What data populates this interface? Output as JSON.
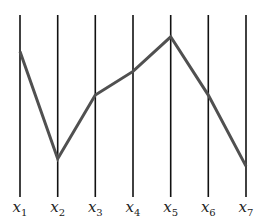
{
  "chart_data": {
    "type": "parallel-coordinates",
    "title": "",
    "axes": [
      "x1",
      "x2",
      "x3",
      "x4",
      "x5",
      "x6",
      "x7"
    ],
    "axis_labels": [
      {
        "base": "x",
        "sub": "1"
      },
      {
        "base": "x",
        "sub": "2"
      },
      {
        "base": "x",
        "sub": "3"
      },
      {
        "base": "x",
        "sub": "4"
      },
      {
        "base": "x",
        "sub": "5"
      },
      {
        "base": "x",
        "sub": "6"
      },
      {
        "base": "x",
        "sub": "7"
      }
    ],
    "series": [
      {
        "name": "polyline",
        "values": [
          0.8,
          0.21,
          0.56,
          0.69,
          0.88,
          0.56,
          0.17
        ]
      }
    ],
    "ylim": [
      0,
      1
    ],
    "grid": false,
    "colors": {
      "axis": "#111111",
      "line": "#505050"
    }
  }
}
